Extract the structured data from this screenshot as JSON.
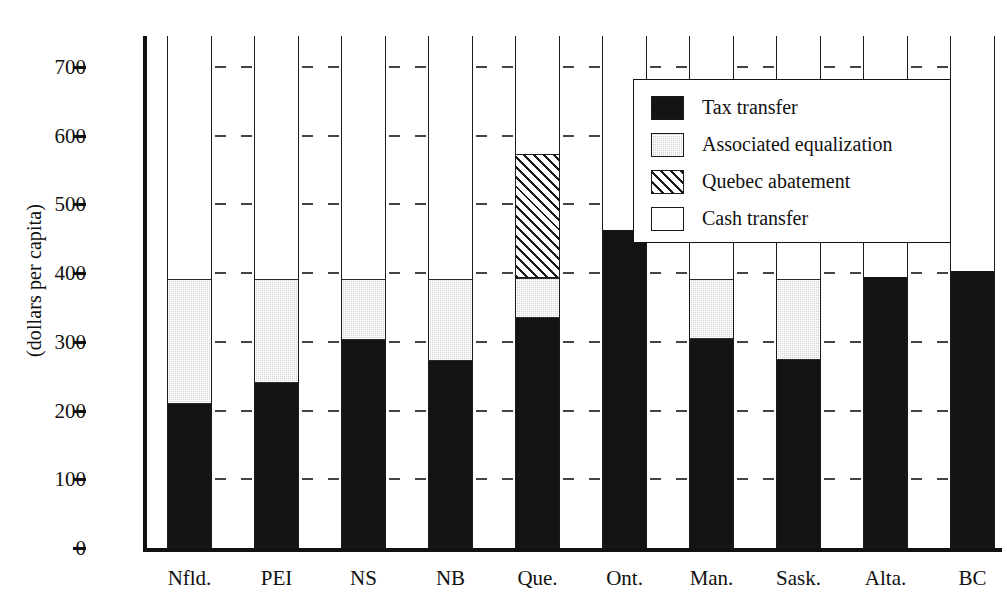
{
  "chart_data": {
    "type": "bar",
    "subtype": "stacked",
    "title": "",
    "xlabel": "",
    "ylabel": "(dollars per capita)",
    "ylim": [
      0,
      745
    ],
    "yticks": [
      0,
      100,
      200,
      300,
      400,
      500,
      600,
      700
    ],
    "ytick_labels": [
      "0",
      "100",
      "200",
      "300",
      "400",
      "500",
      "600",
      "700"
    ],
    "grid": false,
    "legend_position": "upper right",
    "categories": [
      "Nfld.",
      "PEI",
      "NS",
      "NB",
      "Que.",
      "Ont.",
      "Man.",
      "Sask.",
      "Alta.",
      "BC"
    ],
    "series": [
      {
        "name": "Tax transfer",
        "pattern": "solid-black",
        "color": "#141414",
        "values": [
          208,
          238,
          301,
          271,
          333,
          462,
          302,
          272,
          393,
          402
        ]
      },
      {
        "name": "Associated equalization",
        "pattern": "light-stipple",
        "color": "#d2d2d2",
        "values": [
          182,
          152,
          89,
          119,
          59,
          0,
          88,
          118,
          0,
          0
        ]
      },
      {
        "name": "Quebec abatement",
        "pattern": "diagonal-hatch",
        "color": "#ffffff",
        "values": [
          0,
          0,
          0,
          0,
          180,
          0,
          0,
          0,
          0,
          0
        ]
      },
      {
        "name": "Cash transfer",
        "pattern": "open-white",
        "color": "#ffffff",
        "values": [
          355,
          355,
          355,
          355,
          173,
          283,
          355,
          355,
          352,
          343
        ]
      }
    ],
    "stack_totals": [
      745,
      745,
      745,
      745,
      745,
      745,
      745,
      745,
      745,
      745
    ]
  },
  "legend": {
    "items": [
      {
        "label": "Tax transfer",
        "swatch": "solid-black-swatch"
      },
      {
        "label": "Associated equalization",
        "swatch": "light-stipple-swatch"
      },
      {
        "label": "Quebec abatement",
        "swatch": "diagonal-hatch-swatch"
      },
      {
        "label": "Cash transfer",
        "swatch": "open-white-swatch"
      }
    ]
  }
}
